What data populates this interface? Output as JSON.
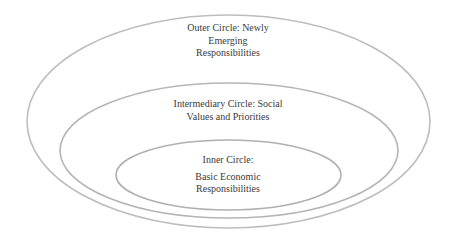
{
  "diagram": {
    "type": "nested-ellipses",
    "stroke_color": "#bdbdbd",
    "background": "#ffffff",
    "circles": [
      {
        "id": "outer",
        "lines": [
          "Outer Circle: Newly",
          "Emerging",
          "Responsibilities"
        ]
      },
      {
        "id": "intermediary",
        "lines": [
          "Intermediary Circle: Social",
          "Values and Priorities"
        ]
      },
      {
        "id": "inner",
        "lines": [
          "Inner Circle:",
          "Basic Economic",
          "Responsibilities"
        ]
      }
    ]
  }
}
